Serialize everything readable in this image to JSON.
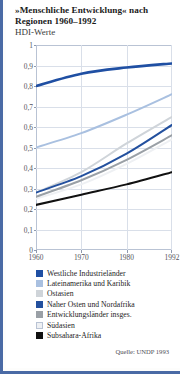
{
  "title": "»Menschliche Entwicklung« nach Regionen 1960–1992",
  "subtitle": "HDI-Werte",
  "source": "Quelle: UNDP 1993",
  "colors": {
    "frame_border": "#4a6aa5",
    "grid": "#d9dfe9",
    "axis_text": "#55555c"
  },
  "chart_data": {
    "type": "line",
    "title": "»Menschliche Entwicklung« nach Regionen 1960–1992",
    "subtitle": "HDI-Werte",
    "xlabel": "",
    "ylabel": "HDI-Werte",
    "x": [
      1960,
      1970,
      1980,
      1992
    ],
    "xticklabels": [
      "1960",
      "1970",
      "1980",
      "1992"
    ],
    "ylim": [
      0,
      1
    ],
    "yticks": [
      0,
      0.1,
      0.2,
      0.3,
      0.4,
      0.5,
      0.6,
      0.7,
      0.8,
      0.9,
      1
    ],
    "yticklabels": [
      "0",
      "0,1",
      "0,2",
      "0,3",
      "0,4",
      "0,5",
      "0,6",
      "0,7",
      "0,8",
      "0,9",
      "1"
    ],
    "grid": true,
    "legend_position": "below",
    "series": [
      {
        "name": "Westliche Industrieländer",
        "color": "#1f4fa3",
        "values": [
          0.8,
          0.86,
          0.89,
          0.91
        ]
      },
      {
        "name": "Lateinamerika und Karibik",
        "color": "#a9c0e0",
        "values": [
          0.5,
          0.57,
          0.66,
          0.76
        ]
      },
      {
        "name": "Ostasien",
        "color": "#cfd4d9",
        "values": [
          0.28,
          0.38,
          0.52,
          0.65
        ]
      },
      {
        "name": "Naher Osten und Nordafrika",
        "color": "#23509e",
        "values": [
          0.28,
          0.36,
          0.47,
          0.61
        ]
      },
      {
        "name": "Entwicklungsländer insges.",
        "color": "#9aa0a6",
        "values": [
          0.26,
          0.34,
          0.44,
          0.56
        ]
      },
      {
        "name": "Südasien",
        "color": "#eef0f3",
        "values": [
          0.25,
          0.32,
          0.42,
          0.54
        ]
      },
      {
        "name": "Subsahara-Afrika",
        "color": "#111111",
        "values": [
          0.22,
          0.27,
          0.32,
          0.38
        ]
      }
    ]
  }
}
